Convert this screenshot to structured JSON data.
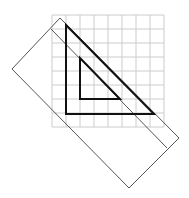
{
  "diagram": {
    "width": 189,
    "height": 198,
    "colors": {
      "grid": "#cccccc",
      "triangle": "#111111",
      "ruler": "#555555",
      "background": "#ffffff"
    },
    "grid": {
      "x0": 52,
      "y0": 15,
      "cell": 14,
      "cols": 8,
      "rows": 8
    },
    "outer_triangle": [
      [
        66,
        25
      ],
      [
        66,
        114
      ],
      [
        154,
        114
      ]
    ],
    "inner_triangle": [
      [
        80,
        58
      ],
      [
        80,
        99
      ],
      [
        120,
        99
      ]
    ],
    "ruler": {
      "outline": [
        [
          60,
          18
        ],
        [
          179,
          138
        ],
        [
          129,
          188
        ],
        [
          12,
          69
        ]
      ],
      "edge_line": [
        [
          51,
          29
        ],
        [
          167,
          148
        ]
      ]
    }
  }
}
